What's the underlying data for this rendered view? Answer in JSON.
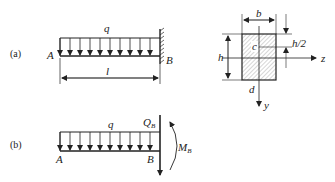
{
  "figure_a": {
    "tag": "(a)",
    "load_label": "q",
    "left_end_label": "A",
    "right_end_label": "B",
    "length_label": "l"
  },
  "cross_section": {
    "width_label": "b",
    "height_label": "h",
    "half_height_label": "h/2",
    "point_c_label": "c",
    "point_d_label": "d",
    "z_axis_label": "z",
    "y_axis_label": "y"
  },
  "figure_b": {
    "tag": "(b)",
    "load_label": "q",
    "left_end_label": "A",
    "right_end_label": "B",
    "shear_label": "Q",
    "shear_sub": "B",
    "moment_label": "M",
    "moment_sub": "B"
  },
  "colors": {
    "line": "#222222",
    "hatch": "#888888",
    "background": "#ffffff"
  }
}
